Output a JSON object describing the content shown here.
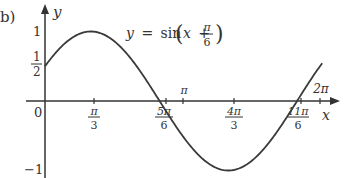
{
  "part_label": "b)",
  "equation": {
    "lhs": "y",
    "eq": "=",
    "fn": "sin",
    "var": "x",
    "plus": "+",
    "frac_num": "π",
    "frac_den": "6"
  },
  "axes": {
    "x_label": "x",
    "y_label": "y",
    "origin_label": "0"
  },
  "y_ticks": [
    {
      "label": "1",
      "value": 1
    },
    {
      "label_num": "1",
      "label_den": "2",
      "value": 0.5
    },
    {
      "label": "−1",
      "value": -1
    }
  ],
  "x_ticks": [
    {
      "num": "π",
      "den": "3"
    },
    {
      "num": "5π",
      "den": "6"
    },
    {
      "num": "π",
      "den": ""
    },
    {
      "num": "4π",
      "den": "3"
    },
    {
      "num": "11π",
      "den": "6"
    },
    {
      "num": "2π",
      "den": ""
    }
  ],
  "colors": {
    "curve": "#3a3a3a",
    "axis": "#333333",
    "text": "#333333"
  },
  "chart_data": {
    "type": "line",
    "xlabel": "x",
    "ylabel": "y",
    "xlim": [
      0,
      6.2832
    ],
    "ylim": [
      -1,
      1
    ],
    "grid": false,
    "x_tick_labels": [
      "π/3",
      "5π/6",
      "π",
      "4π/3",
      "11π/6",
      "2π"
    ],
    "x_tick_values": [
      1.0472,
      2.618,
      3.1416,
      4.1888,
      5.7596,
      6.2832
    ],
    "y_tick_labels": [
      "1",
      "1/2",
      "−1"
    ],
    "y_tick_values": [
      1,
      0.5,
      -1
    ],
    "series": [
      {
        "name": "y = sin(x + π/6)",
        "x": [
          0,
          1.0472,
          2.618,
          4.1888,
          5.7596,
          6.2832
        ],
        "values": [
          0.5,
          1,
          0,
          -1,
          0,
          0.5
        ]
      }
    ],
    "annotations": [
      "y-intercept (0, 1/2)",
      "maximum at (π/3, 1)",
      "root at 5π/6",
      "minimum at (4π/3, −1)",
      "root at 11π/6"
    ]
  }
}
